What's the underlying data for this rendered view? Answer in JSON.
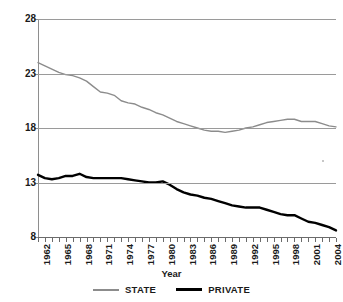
{
  "top_sliver_text": "",
  "axis": {
    "y_ticks": [
      28,
      23,
      18,
      13,
      8
    ],
    "y_title": "",
    "x_title": "Year",
    "x_tick_labels": [
      "1962",
      "1965",
      "1968",
      "1971",
      "1974",
      "1977",
      "1980",
      "1983",
      "1986",
      "1989",
      "1992",
      "1995",
      "1998",
      "2001",
      "2004"
    ]
  },
  "legend": {
    "items": [
      {
        "label": "STATE",
        "color": "#8c8c8c"
      },
      {
        "label": "PRIVATE",
        "color": "#000000"
      }
    ]
  },
  "colors": {
    "state": "#8c8c8c",
    "private": "#000000",
    "grid": "#9a9a9a",
    "axis": "#6b6b6b",
    "background": "#ffffff"
  },
  "chart_data": {
    "type": "line",
    "title": "",
    "xlabel": "Year",
    "ylabel": "",
    "xlim": [
      1962,
      2005
    ],
    "ylim": [
      8,
      28
    ],
    "y_ticks": [
      8,
      13,
      18,
      23,
      28
    ],
    "grid": true,
    "legend_position": "bottom-center",
    "x": [
      1962,
      1963,
      1964,
      1965,
      1966,
      1967,
      1968,
      1969,
      1970,
      1971,
      1972,
      1973,
      1974,
      1975,
      1976,
      1977,
      1978,
      1979,
      1980,
      1981,
      1982,
      1983,
      1984,
      1985,
      1986,
      1987,
      1988,
      1989,
      1990,
      1991,
      1992,
      1993,
      1994,
      1995,
      1996,
      1997,
      1998,
      1999,
      2000,
      2001,
      2002,
      2003,
      2004,
      2005
    ],
    "series": [
      {
        "name": "STATE",
        "color": "#8c8c8c",
        "values": [
          24.0,
          23.7,
          23.4,
          23.1,
          22.9,
          22.8,
          22.6,
          22.3,
          21.8,
          21.3,
          21.2,
          21.0,
          20.5,
          20.3,
          20.2,
          19.9,
          19.7,
          19.4,
          19.2,
          18.9,
          18.6,
          18.4,
          18.2,
          18.0,
          17.8,
          17.7,
          17.7,
          17.6,
          17.7,
          17.8,
          18.0,
          18.1,
          18.3,
          18.5,
          18.6,
          18.7,
          18.8,
          18.8,
          18.6,
          18.6,
          18.6,
          18.4,
          18.2,
          18.1
        ]
      },
      {
        "name": "PRIVATE",
        "color": "#000000",
        "values": [
          13.7,
          13.4,
          13.3,
          13.4,
          13.6,
          13.6,
          13.8,
          13.5,
          13.4,
          13.4,
          13.4,
          13.4,
          13.4,
          13.3,
          13.2,
          13.1,
          13.0,
          13.0,
          13.1,
          12.8,
          12.4,
          12.1,
          11.9,
          11.8,
          11.6,
          11.5,
          11.3,
          11.1,
          10.9,
          10.8,
          10.7,
          10.7,
          10.7,
          10.5,
          10.3,
          10.1,
          10.0,
          10.0,
          9.7,
          9.4,
          9.3,
          9.1,
          8.9,
          8.6
        ]
      }
    ]
  }
}
